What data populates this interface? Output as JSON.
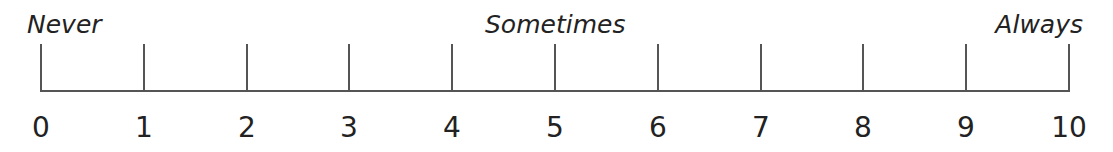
{
  "scale": {
    "anchors": {
      "left": "Never",
      "middle": "Sometimes",
      "right": "Always"
    },
    "ticks": [
      "0",
      "1",
      "2",
      "3",
      "4",
      "5",
      "6",
      "7",
      "8",
      "9",
      "10"
    ],
    "colors": {
      "line": "#555555",
      "text": "#222222"
    }
  }
}
